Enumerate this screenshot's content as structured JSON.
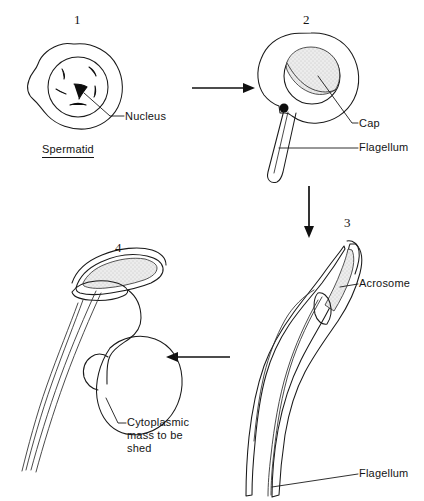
{
  "figure": {
    "background_color": "#ffffff",
    "ink_color": "#1a1a1a",
    "shade_color": "#e0e0e0"
  },
  "stages": [
    {
      "number": "1",
      "caption": "Spermatid",
      "labels": [
        "Nucleus"
      ]
    },
    {
      "number": "2",
      "caption": "",
      "labels": [
        "Cap",
        "Flagellum"
      ]
    },
    {
      "number": "3",
      "caption": "",
      "labels": [
        "Acrosome",
        "Flagellum"
      ]
    },
    {
      "number": "4",
      "caption": "",
      "labels": [
        "Cytoplasmic\nmass to be\nshed"
      ]
    }
  ],
  "labels": {
    "nucleus": "Nucleus",
    "spermatid": "Spermatid",
    "cap": "Cap",
    "flagellum_stage2": "Flagellum",
    "acrosome": "Acrosome",
    "flagellum_stage3": "Flagellum",
    "cytoplasmic_mass": "Cytoplasmic\nmass to be\nshed"
  },
  "stage_numbers": {
    "one": "1",
    "two": "2",
    "three": "3",
    "four": "4"
  },
  "arrows": [
    {
      "name": "arrow-stage1-to-stage2",
      "direction": "right"
    },
    {
      "name": "arrow-stage2-to-stage3",
      "direction": "down"
    },
    {
      "name": "arrow-stage3-to-stage4",
      "direction": "left"
    }
  ]
}
